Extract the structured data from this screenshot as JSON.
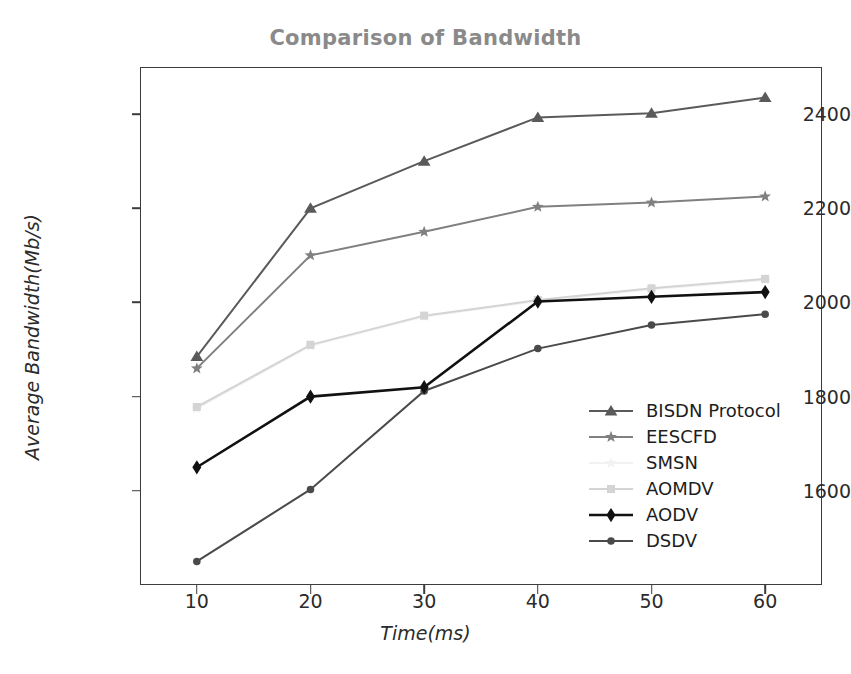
{
  "chart_data": {
    "type": "line",
    "title": "Comparison of Bandwidth",
    "xlabel": "Time(ms)",
    "ylabel": "Average Bandwidth(Mb/s)",
    "x": [
      10,
      20,
      30,
      40,
      50,
      60
    ],
    "xticks": [
      "10",
      "20",
      "30",
      "40",
      "50",
      "60"
    ],
    "yticks": [
      "1600",
      "1800",
      "2000",
      "2200",
      "2400"
    ],
    "ytick_values": [
      1600,
      1800,
      2000,
      2200,
      2400
    ],
    "xlim": [
      5,
      65
    ],
    "ylim": [
      1400,
      2500
    ],
    "grid": false,
    "legend_position": "lower right",
    "series": [
      {
        "name": "BISDN Protocol",
        "values": [
          1885,
          2200,
          2300,
          2393,
          2402,
          2435
        ],
        "color": "#5a5a5a",
        "marker": "triangle"
      },
      {
        "name": "EESCFD",
        "values": [
          1860,
          2100,
          2150,
          2203,
          2212,
          2225
        ],
        "color": "#808080",
        "marker": "star"
      },
      {
        "name": "SMSN",
        "values": [
          1775,
          1908,
          1970,
          2003,
          2028,
          2048
        ],
        "color": "#f2f2f2",
        "marker": "star"
      },
      {
        "name": "AOMDV",
        "values": [
          1778,
          1910,
          1972,
          2005,
          2030,
          2050
        ],
        "color": "#d4d4d4",
        "marker": "square"
      },
      {
        "name": "AODV",
        "values": [
          1650,
          1800,
          1820,
          2002,
          2012,
          2022
        ],
        "color": "#111111",
        "marker": "diamond"
      },
      {
        "name": "DSDV",
        "values": [
          1450,
          1603,
          1812,
          1902,
          1952,
          1975
        ],
        "color": "#4a4a4a",
        "marker": "circle"
      }
    ]
  },
  "title_color": "#8a8a8a",
  "axis_color": "#3c3c3c"
}
